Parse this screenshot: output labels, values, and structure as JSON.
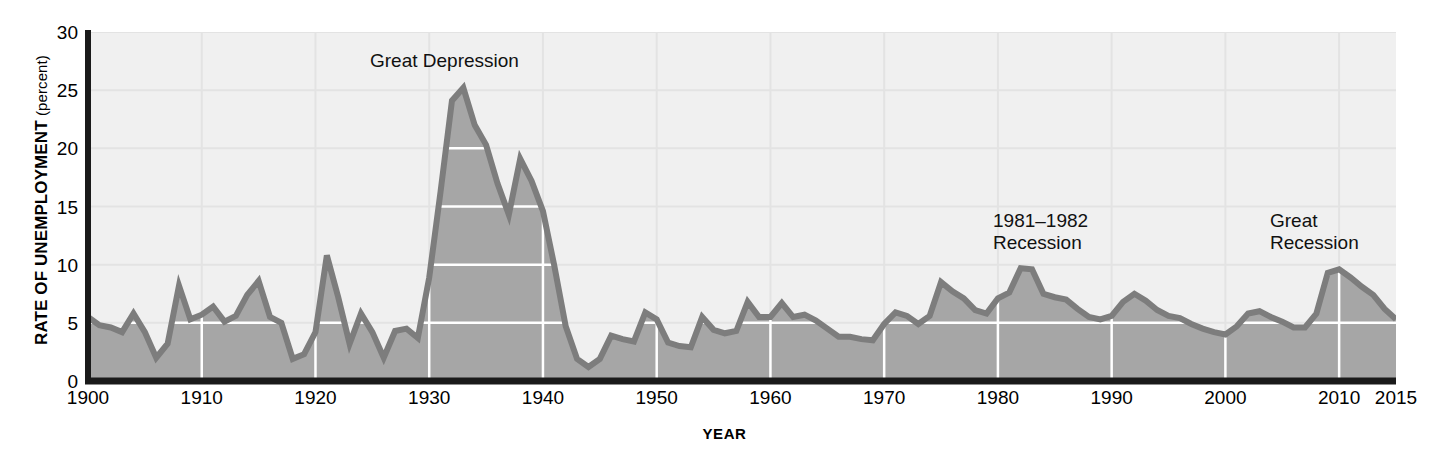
{
  "axes": {
    "y_title_main": "RATE OF UNEMPLOYMENT",
    "y_title_unit": "(percent)",
    "x_title": "YEAR",
    "y_ticks": [
      0,
      5,
      10,
      15,
      20,
      25,
      30
    ],
    "x_ticks": [
      1900,
      1910,
      1920,
      1930,
      1940,
      1950,
      1960,
      1970,
      1980,
      1990,
      2000,
      2010,
      2015
    ]
  },
  "annotations": {
    "great_depression": "Great Depression",
    "recession_1981_1982": "1981–1982\nRecession",
    "great_recession": "Great\nRecession"
  },
  "colors": {
    "plot_background": "#f0f0f0",
    "area_fill": "#a6a6a6",
    "line_stroke": "#7d7d7d",
    "gridline_in_fill": "#ffffff",
    "gridline_above_fill": "#e3e3e3",
    "axis": "#1a1a1a",
    "text": "#000000"
  },
  "chart_data": {
    "type": "area",
    "title": "",
    "subtitle": "",
    "xlabel": "YEAR",
    "ylabel": "RATE OF UNEMPLOYMENT (percent)",
    "xlim": [
      1900,
      2015
    ],
    "ylim": [
      0,
      30
    ],
    "grid": true,
    "legend_position": "none",
    "series_name": "Rate of unemployment (percent)",
    "x": [
      1900,
      1901,
      1902,
      1903,
      1904,
      1905,
      1906,
      1907,
      1908,
      1909,
      1910,
      1911,
      1912,
      1913,
      1914,
      1915,
      1916,
      1917,
      1918,
      1919,
      1920,
      1921,
      1922,
      1923,
      1924,
      1925,
      1926,
      1927,
      1928,
      1929,
      1930,
      1931,
      1932,
      1933,
      1934,
      1935,
      1936,
      1937,
      1938,
      1939,
      1940,
      1941,
      1942,
      1943,
      1944,
      1945,
      1946,
      1947,
      1948,
      1949,
      1950,
      1951,
      1952,
      1953,
      1954,
      1955,
      1956,
      1957,
      1958,
      1959,
      1960,
      1961,
      1962,
      1963,
      1964,
      1965,
      1966,
      1967,
      1968,
      1969,
      1970,
      1971,
      1972,
      1973,
      1974,
      1975,
      1976,
      1977,
      1978,
      1979,
      1980,
      1981,
      1982,
      1983,
      1984,
      1985,
      1986,
      1987,
      1988,
      1989,
      1990,
      1991,
      1992,
      1993,
      1994,
      1995,
      1996,
      1997,
      1998,
      1999,
      2000,
      2001,
      2002,
      2003,
      2004,
      2005,
      2006,
      2007,
      2008,
      2009,
      2010,
      2011,
      2012,
      2013,
      2014,
      2015
    ],
    "y": [
      5.5,
      4.8,
      4.6,
      4.2,
      5.8,
      4.2,
      2.0,
      3.2,
      8.2,
      5.3,
      5.7,
      6.4,
      5.1,
      5.6,
      7.4,
      8.6,
      5.5,
      5.0,
      1.9,
      2.3,
      4.2,
      10.8,
      7.2,
      3.2,
      5.8,
      4.2,
      2.0,
      4.3,
      4.5,
      3.7,
      8.9,
      16.3,
      24.1,
      25.2,
      22.0,
      20.3,
      17.0,
      14.3,
      19.1,
      17.2,
      14.6,
      9.9,
      4.7,
      1.9,
      1.2,
      1.9,
      3.9,
      3.6,
      3.4,
      5.9,
      5.3,
      3.3,
      3.0,
      2.9,
      5.5,
      4.4,
      4.1,
      4.3,
      6.8,
      5.5,
      5.5,
      6.7,
      5.5,
      5.7,
      5.2,
      4.5,
      3.8,
      3.8,
      3.6,
      3.5,
      4.9,
      5.9,
      5.6,
      4.9,
      5.6,
      8.5,
      7.7,
      7.1,
      6.1,
      5.8,
      7.1,
      7.6,
      9.7,
      9.6,
      7.5,
      7.2,
      7.0,
      6.2,
      5.5,
      5.3,
      5.6,
      6.8,
      7.5,
      6.9,
      6.1,
      5.6,
      5.4,
      4.9,
      4.5,
      4.2,
      4.0,
      4.7,
      5.8,
      6.0,
      5.5,
      5.1,
      4.6,
      4.6,
      5.8,
      9.3,
      9.6,
      8.9,
      8.1,
      7.4,
      6.2,
      5.3
    ],
    "annotations": [
      {
        "label": "Great Depression",
        "x_range": [
          1929,
          1939
        ],
        "peak_x": 1933,
        "peak_y": 25.2
      },
      {
        "label": "1981–1982 Recession",
        "x_range": [
          1981,
          1982
        ],
        "peak_x": 1982,
        "peak_y": 9.7
      },
      {
        "label": "Great Recession",
        "x_range": [
          2008,
          2010
        ],
        "peak_x": 2010,
        "peak_y": 9.6
      }
    ]
  }
}
